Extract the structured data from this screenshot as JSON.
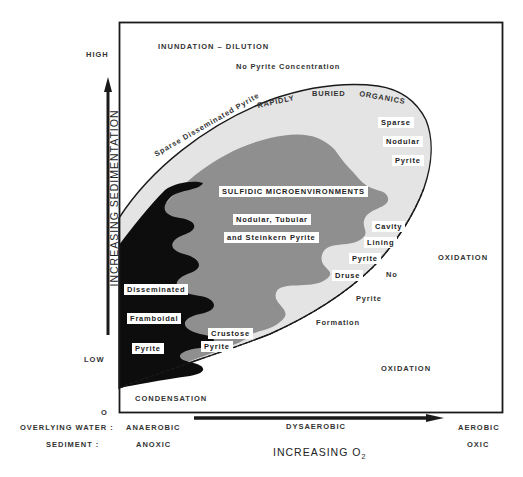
{
  "y_axis": {
    "title": "INCREASING SEDIMENTATION",
    "high": "HIGH",
    "low": "LOW",
    "zero": "O"
  },
  "x_axis": {
    "title_main": "INCREASING O",
    "title_sub": "2",
    "row_labels": {
      "water": "OVERLYING  WATER :",
      "sediment": "SEDIMENT :"
    },
    "water": {
      "anaerobic": "ANAEROBIC",
      "dysaerobic": "DYSAEROBIC",
      "aerobic": "AEROBIC"
    },
    "sediment": {
      "anoxic": "ANOXIC",
      "oxic": "OXIC"
    }
  },
  "regions": {
    "inundation": "INUNDATION  –  DILUTION",
    "no_pyrite_conc": "No Pyrite Concentration",
    "rapidly": "RAPIDLY",
    "buried": "BURIED",
    "organics": "ORGANICS",
    "sparse_diss": "Sparse Disseminated Pyrite",
    "sparse_nodular": [
      "Sparse",
      "Nodular",
      "Pyrite"
    ],
    "sulfidic": "SULFIDIC MICROENVIRONMENTS",
    "nodular_tubular": [
      "Nodular, Tubular",
      "and Steinkern Pyrite"
    ],
    "cavity": [
      "Cavity",
      "Lining",
      "Pyrite",
      "Druse"
    ],
    "no_pyrite_formation": [
      "No",
      "Pyrite",
      "Formation"
    ],
    "oxidation_upper": "OXIDATION",
    "oxidation_lower": "OXIDATION",
    "disseminated": [
      "Disseminated",
      "Framboidal",
      "Pyrite"
    ],
    "crustose": [
      "Crustose",
      "Pyrite"
    ],
    "condensation": "CONDENSATION"
  },
  "colors": {
    "frame": "#1a1a1a",
    "outer_zone": "#e4e4e4",
    "sulfidic_zone": "#8f8f8f",
    "framboidal_zone": "#0d0d0d",
    "background": "#ffffff"
  }
}
